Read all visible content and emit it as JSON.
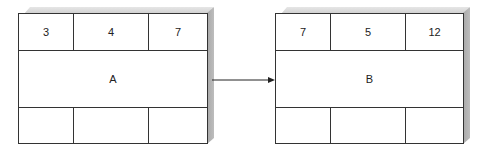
{
  "diagram": {
    "nodes": [
      {
        "id": "A",
        "label": "A",
        "top_cells": [
          "3",
          "4",
          "7"
        ],
        "bottom_cells": [
          "",
          "",
          ""
        ]
      },
      {
        "id": "B",
        "label": "B",
        "top_cells": [
          "7",
          "5",
          "12"
        ],
        "bottom_cells": [
          "",
          "",
          ""
        ]
      }
    ],
    "edges": [
      {
        "from": "A",
        "to": "B"
      }
    ]
  }
}
